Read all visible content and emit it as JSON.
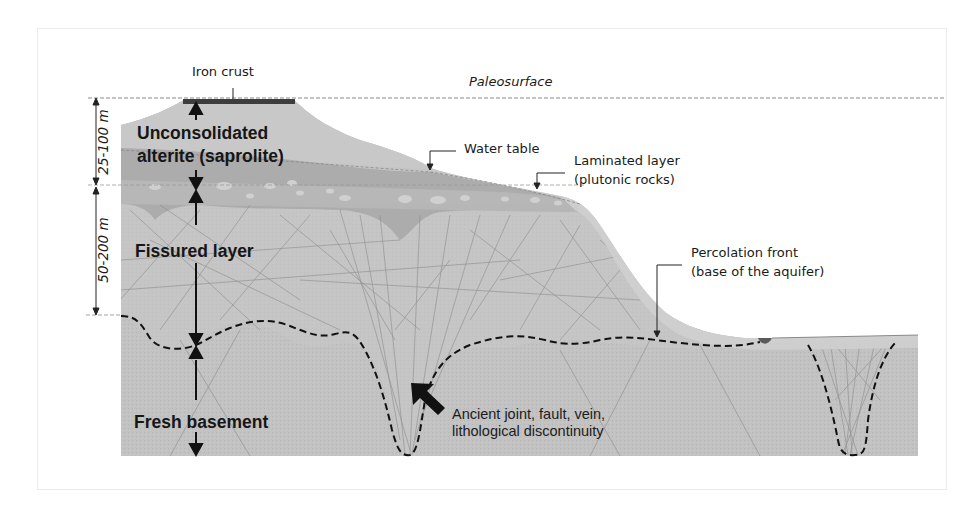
{
  "diagram": {
    "colors": {
      "background": "#ffffff",
      "frame": "#ececec",
      "saprolite_upper": "#c4c4c4",
      "saprolite_lower": "#a9a9a9",
      "fissured": "#bdbdbd",
      "basement": "#c2c2c2",
      "iron_crust": "#3d3d3d",
      "fracture_lines": "#8f8f8f",
      "dashed_lines": "#1a1a1a",
      "text": "#1a1a1a"
    },
    "labels": {
      "paleosurface": "Paleosurface",
      "iron_crust": "Iron crust",
      "water_table": "Water table",
      "laminated_layer_line1": "Laminated layer",
      "laminated_layer_line2": "(plutonic rocks)",
      "percolation_front_line1": "Percolation front",
      "percolation_front_line2": "(base of the aquifer)",
      "discontinuity_line1": "Ancient joint, fault, vein,",
      "discontinuity_line2": "lithological discontinuity"
    },
    "layers": {
      "saprolite_line1": "Unconsolidated",
      "saprolite_line2": "alterite (saprolite)",
      "fissured": "Fissured layer",
      "basement": "Fresh basement"
    },
    "dimensions": {
      "saprolite_thickness": "25-100 m",
      "fissured_thickness": "50-200 m"
    }
  }
}
